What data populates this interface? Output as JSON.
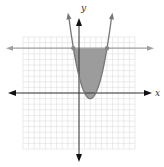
{
  "chart_data": {
    "type": "line",
    "title": "",
    "xlabel": "x",
    "ylabel": "y",
    "xlim": [
      -10,
      10
    ],
    "ylim": [
      -10,
      10
    ],
    "grid": true,
    "series": [
      {
        "name": "parabola",
        "equation": "y = x^2 - 4x + 3",
        "vertex": [
          2,
          -1
        ],
        "color": "#777777"
      },
      {
        "name": "horizontal line",
        "equation": "y = 8",
        "color": "#999999"
      }
    ],
    "intersection_points": [
      [
        -1,
        8
      ],
      [
        5,
        8
      ]
    ],
    "shaded_region": {
      "description": "region between parabola and line y=8",
      "x_range": [
        -1,
        5
      ],
      "color": "#9a9a9a"
    }
  },
  "labels": {
    "x_axis": "x",
    "y_axis": "y"
  }
}
